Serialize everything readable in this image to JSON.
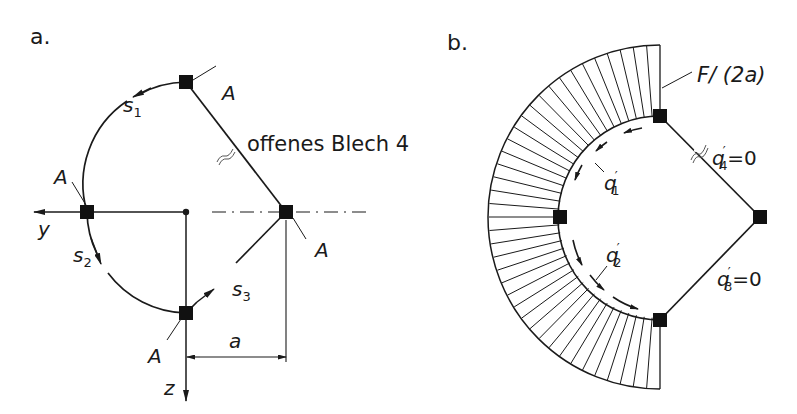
{
  "panels": [
    {
      "id": "a",
      "label": "a.",
      "nodes": {
        "top": "A",
        "left": "A",
        "right": "A",
        "bottom": "A"
      },
      "segments": {
        "s1": {
          "base": "s",
          "sub": "1"
        },
        "s2": {
          "base": "s",
          "sub": "2"
        },
        "s3": {
          "base": "s",
          "sub": "3"
        }
      },
      "axes": {
        "y": "y",
        "z": "z"
      },
      "dimension": "a",
      "annotation": "offenes Blech 4"
    },
    {
      "id": "b",
      "label": "b.",
      "load_label": "F/ (2a)",
      "flows": {
        "q1": {
          "base": "q",
          "sup": "′",
          "sub": "1"
        },
        "q2": {
          "base": "q",
          "sup": "′",
          "sub": "2"
        },
        "q3": {
          "base": "q",
          "sup": "′",
          "sub": "3",
          "value": "=0"
        },
        "q4": {
          "base": "q",
          "sup": "′",
          "sub": "4",
          "value": "=0"
        }
      }
    }
  ],
  "colors": {
    "ink": "#1a1a1a",
    "background": "#ffffff"
  }
}
